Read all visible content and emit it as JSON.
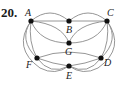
{
  "problem_number": "20.",
  "graph": {
    "vertices": [
      {
        "id": "A",
        "label": "A",
        "x": 31,
        "y": 21
      },
      {
        "id": "B",
        "label": "B",
        "x": 69,
        "y": 21
      },
      {
        "id": "C",
        "label": "C",
        "x": 107,
        "y": 21
      },
      {
        "id": "G",
        "label": "G",
        "x": 69,
        "y": 43
      },
      {
        "id": "F",
        "label": "F",
        "x": 37,
        "y": 58
      },
      {
        "id": "E",
        "label": "E",
        "x": 69,
        "y": 66
      },
      {
        "id": "D",
        "label": "D",
        "x": 101,
        "y": 58
      }
    ],
    "edges": [
      [
        "A",
        "B"
      ],
      [
        "A",
        "B"
      ],
      [
        "B",
        "C"
      ],
      [
        "B",
        "C"
      ],
      [
        "A",
        "G"
      ],
      [
        "A",
        "G"
      ],
      [
        "C",
        "G"
      ],
      [
        "C",
        "G"
      ],
      [
        "A",
        "F"
      ],
      [
        "A",
        "F"
      ],
      [
        "C",
        "D"
      ],
      [
        "C",
        "D"
      ],
      [
        "F",
        "E"
      ],
      [
        "F",
        "E"
      ],
      [
        "E",
        "D"
      ],
      [
        "E",
        "D"
      ],
      [
        "A",
        "E"
      ],
      [
        "C",
        "E"
      ]
    ]
  }
}
